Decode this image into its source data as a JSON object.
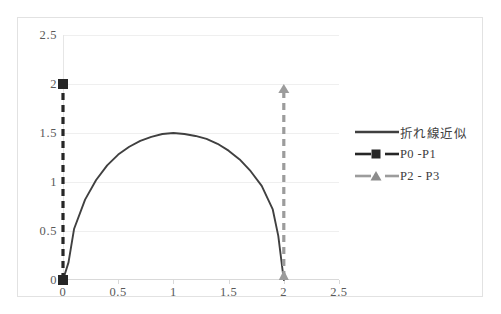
{
  "chart_data": {
    "type": "line",
    "title": "",
    "xlabel": "",
    "ylabel": "",
    "xlim": [
      0,
      2.5
    ],
    "ylim": [
      0,
      2.5
    ],
    "grid": true,
    "legend_position": "right",
    "x_ticks": [
      "0",
      "0.5",
      "1",
      "1.5",
      "2",
      "2.5"
    ],
    "x_tick_values": [
      0,
      0.5,
      1,
      1.5,
      2,
      2.5
    ],
    "y_ticks": [
      "0",
      "0.5",
      "1",
      "1.5",
      "2",
      "2.5"
    ],
    "y_tick_values": [
      0,
      0.5,
      1,
      1.5,
      2,
      2.5
    ],
    "series": [
      {
        "name": "折れ線近似",
        "style": "solid",
        "color": "#404040",
        "marker": "none",
        "x": [
          0.0,
          0.05,
          0.1,
          0.2,
          0.3,
          0.4,
          0.5,
          0.6,
          0.7,
          0.8,
          0.9,
          1.0,
          1.1,
          1.2,
          1.3,
          1.4,
          1.5,
          1.6,
          1.7,
          1.8,
          1.9,
          1.95,
          2.0
        ],
        "values": [
          0.0,
          0.18,
          0.52,
          0.82,
          1.02,
          1.17,
          1.28,
          1.36,
          1.42,
          1.46,
          1.49,
          1.5,
          1.49,
          1.47,
          1.44,
          1.39,
          1.32,
          1.23,
          1.11,
          0.96,
          0.72,
          0.45,
          0.0
        ]
      },
      {
        "name": "P0 -P1",
        "style": "dashed",
        "color": "#262626",
        "marker": "square",
        "x": [
          0,
          0
        ],
        "values": [
          0,
          2
        ]
      },
      {
        "name": "P2 - P3",
        "style": "dashed",
        "color": "#9c9c9c",
        "marker": "triangle-arrow",
        "x": [
          2,
          2
        ],
        "values": [
          0,
          2
        ]
      }
    ]
  },
  "legend": {
    "entries": [
      {
        "label": "折れ線近似",
        "key": "solid-line-key"
      },
      {
        "label": "P0 -P1",
        "key": "dashed-square-key"
      },
      {
        "label": "P2 - P3",
        "key": "dashed-triangle-key"
      }
    ]
  },
  "colors": {
    "series_line": "#404040",
    "p0p1": "#262626",
    "p2p3": "#9c9c9c",
    "gridline": "#efefef",
    "frame_border": "#e2e2e2",
    "tick_text": "#595959"
  }
}
